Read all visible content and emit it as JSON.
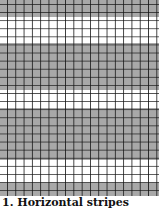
{
  "figure": {
    "bands": [
      {
        "color": "#a8a8a8",
        "top": 0,
        "height": 17
      },
      {
        "color": "#ffffff",
        "top": 17,
        "height": 26
      },
      {
        "color": "#a8a8a8",
        "top": 43,
        "height": 47
      },
      {
        "color": "#ffffff",
        "top": 90,
        "height": 18
      },
      {
        "color": "#a8a8a8",
        "top": 108,
        "height": 52
      },
      {
        "color": "#ffffff",
        "top": 160,
        "height": 23
      },
      {
        "color": "#a8a8a8",
        "top": 183,
        "height": 13
      }
    ],
    "grid_line_color": "#141414"
  },
  "caption": {
    "text": "1. Horizontal stripes"
  }
}
